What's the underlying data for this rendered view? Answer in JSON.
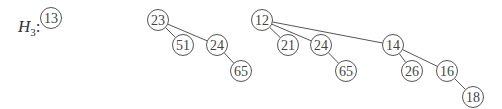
{
  "heap_label": {
    "name": "H",
    "subscript": "3",
    "suffix": ":"
  },
  "trees": [
    {
      "id": "tree-13",
      "nodes": [
        {
          "id": "a1",
          "value": "13",
          "x": 51,
          "y": 18
        }
      ],
      "edges": []
    },
    {
      "id": "tree-23",
      "nodes": [
        {
          "id": "b1",
          "value": "23",
          "x": 158,
          "y": 20
        },
        {
          "id": "b2",
          "value": "51",
          "x": 183,
          "y": 45
        },
        {
          "id": "b3",
          "value": "24",
          "x": 217,
          "y": 45
        },
        {
          "id": "b4",
          "value": "65",
          "x": 241,
          "y": 71
        }
      ],
      "edges": [
        [
          "b1",
          "b2"
        ],
        [
          "b1",
          "b3"
        ],
        [
          "b3",
          "b4"
        ]
      ]
    },
    {
      "id": "tree-12",
      "nodes": [
        {
          "id": "c1",
          "value": "12",
          "x": 262,
          "y": 20
        },
        {
          "id": "c2",
          "value": "21",
          "x": 288,
          "y": 45
        },
        {
          "id": "c3",
          "value": "24",
          "x": 321,
          "y": 45
        },
        {
          "id": "c4",
          "value": "65",
          "x": 346,
          "y": 71
        },
        {
          "id": "c5",
          "value": "14",
          "x": 393,
          "y": 45
        },
        {
          "id": "c6",
          "value": "26",
          "x": 412,
          "y": 71
        },
        {
          "id": "c7",
          "value": "16",
          "x": 447,
          "y": 71
        },
        {
          "id": "c8",
          "value": "18",
          "x": 473,
          "y": 97
        }
      ],
      "edges": [
        [
          "c1",
          "c2"
        ],
        [
          "c1",
          "c3"
        ],
        [
          "c1",
          "c5"
        ],
        [
          "c3",
          "c4"
        ],
        [
          "c5",
          "c6"
        ],
        [
          "c5",
          "c7"
        ],
        [
          "c7",
          "c8"
        ]
      ]
    }
  ],
  "style": {
    "stroke": "#555555",
    "text": "#444444",
    "radius": 10.5
  }
}
